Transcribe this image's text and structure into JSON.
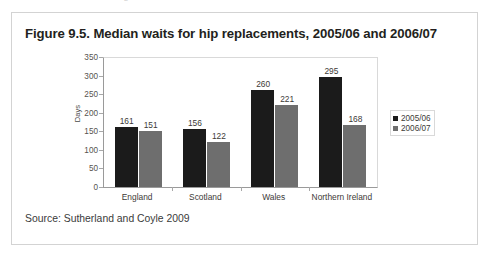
{
  "scan": {
    "top_cutoff_text": "and the distribution of waiting times"
  },
  "figure": {
    "title": "Figure 9.5. Median waits for hip replacements, 2005/06 and 2006/07",
    "source": "Source: Sutherland and Coyle 2009"
  },
  "colors": {
    "series_2005_06": "#1b1b1b",
    "series_2006_07": "#6e6e6e",
    "figure_border": "#d3d3d3",
    "plot_border": "#d9d9d9",
    "axis_line": "#9a9a9a",
    "text": "#231f20"
  },
  "chart_data": {
    "type": "bar",
    "title": "Figure 9.5. Median waits for hip replacements, 2005/06 and 2006/07",
    "xlabel": "",
    "ylabel": "Days",
    "ylim": [
      0,
      350
    ],
    "yticks": [
      350,
      300,
      250,
      200,
      150,
      100,
      50,
      0
    ],
    "grid": false,
    "legend_position": "right",
    "categories": [
      "England",
      "Scotland",
      "Wales",
      "Northern Ireland"
    ],
    "series": [
      {
        "name": "2005/06",
        "color": "#1b1b1b",
        "values": [
          161,
          156,
          260,
          295
        ]
      },
      {
        "name": "2006/07",
        "color": "#6e6e6e",
        "values": [
          151,
          122,
          221,
          168
        ]
      }
    ],
    "data_labels": [
      [
        "161",
        "151"
      ],
      [
        "156",
        "122"
      ],
      [
        "260",
        "221"
      ],
      [
        "295",
        "168"
      ]
    ]
  }
}
